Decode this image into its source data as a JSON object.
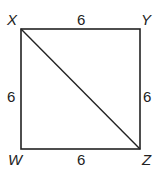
{
  "diagram": {
    "shape": "square with diagonal",
    "vertices": [
      {
        "name": "X",
        "position": "top-left"
      },
      {
        "name": "Y",
        "position": "top-right"
      },
      {
        "name": "Z",
        "position": "bottom-right"
      },
      {
        "name": "W",
        "position": "bottom-left"
      }
    ],
    "sides": {
      "XY": "6",
      "YZ": "6",
      "WZ": "6",
      "XW": "6"
    },
    "diagonal": "XZ",
    "line_color": "#222222"
  }
}
